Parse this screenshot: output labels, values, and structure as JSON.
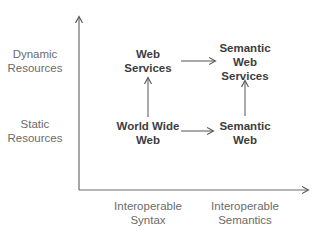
{
  "diagram": {
    "y_axis": {
      "labels": [
        {
          "line1": "Dynamic",
          "line2": "Resources"
        },
        {
          "line1": "Static",
          "line2": "Resources"
        }
      ]
    },
    "x_axis": {
      "labels": [
        {
          "line1": "Interoperable",
          "line2": "Syntax"
        },
        {
          "line1": "Interoperable",
          "line2": "Semantics"
        }
      ]
    },
    "nodes": {
      "web_services": {
        "line1": "Web",
        "line2": "Services"
      },
      "semantic_web_services": {
        "line1": "Semantic",
        "line2": "Web",
        "line3": "Services"
      },
      "world_wide_web": {
        "line1": "World Wide",
        "line2": "Web"
      },
      "semantic_web": {
        "line1": "Semantic",
        "line2": "Web"
      }
    },
    "edges": [
      {
        "from": "World Wide Web",
        "to": "Web Services"
      },
      {
        "from": "World Wide Web",
        "to": "Semantic Web"
      },
      {
        "from": "Web Services",
        "to": "Semantic Web Services"
      },
      {
        "from": "Semantic Web",
        "to": "Semantic Web Services"
      }
    ],
    "colors": {
      "axis": "#6b6b6b",
      "arrow": "#555555",
      "node_text": "#3d3d3d",
      "axis_text": "#6b6b6b"
    }
  }
}
